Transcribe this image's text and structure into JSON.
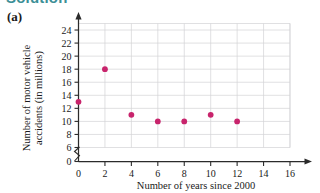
{
  "heading": {
    "text": "Solution",
    "color": "#3c8f96"
  },
  "part_label": "(a)",
  "chart_data": {
    "type": "scatter",
    "title": "",
    "xlabel": "Number of years since 2000",
    "ylabel": "Number of motor vehicle accidents (in millions)",
    "ylabel_line1": "Number of motor vehicle",
    "ylabel_line2": "accidents (in millions)",
    "x": [
      0,
      2,
      4,
      6,
      8,
      10,
      12
    ],
    "values": [
      13,
      18,
      11,
      10,
      10,
      11,
      10
    ],
    "points": [
      {
        "x": 0,
        "y": 13
      },
      {
        "x": 2,
        "y": 18
      },
      {
        "x": 4,
        "y": 11
      },
      {
        "x": 6,
        "y": 10
      },
      {
        "x": 8,
        "y": 10
      },
      {
        "x": 10,
        "y": 11
      },
      {
        "x": 12,
        "y": 10
      }
    ],
    "xticks": [
      0,
      2,
      4,
      6,
      8,
      10,
      12,
      14,
      16
    ],
    "yticks": [
      0,
      6,
      8,
      10,
      12,
      14,
      16,
      18,
      20,
      22,
      24
    ],
    "xlim": [
      0,
      16
    ],
    "ylim": [
      6,
      25
    ],
    "y_axis_break": true,
    "y_break_between": [
      0,
      6
    ],
    "grid": true,
    "grid_color": "#d2d2d6",
    "marker_color": "#c8246c",
    "axis_color": "#2b2b2b",
    "legend": null
  }
}
